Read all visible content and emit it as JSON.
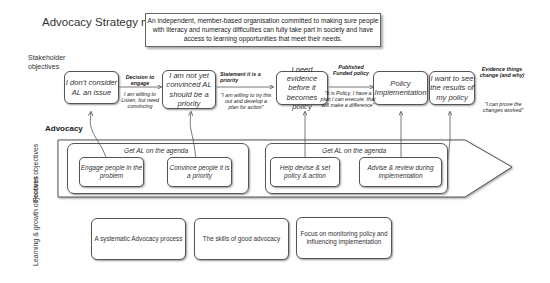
{
  "title": "Advocacy Strategy map",
  "mission": "An independent, member-based organisation committed to making sure people with literacy and numeracy difficulties can fully take part in society and have access to learning opportunities that meet their needs.",
  "row_labels": {
    "stakeholder": "Stakeholder objectives",
    "process": "Process objectives",
    "learning": "Learning & growth objectives"
  },
  "stakeholder_boxes": [
    {
      "text": "I don't consider AL an issue"
    },
    {
      "text": "I am not yet convinced AL should be a priority"
    },
    {
      "text": "I need evidence before it becomes policy"
    },
    {
      "text": "Policy Implementation"
    },
    {
      "text": "I want to see the results of my policy"
    }
  ],
  "transitions": [
    {
      "label": "Decision to engage",
      "quote": "I am willing to Listen, but need convincing"
    },
    {
      "label": "Statement it is a priority",
      "quote": "\"I am willing to try this out and develop a plan for action\""
    },
    {
      "label": "Published Funded policy",
      "quote": "\"It is Policy, I have a plan I can execute, that will make a difference\""
    },
    {
      "label": "Evidence things change (and why)",
      "quote": "\"I can prove the changes worked\""
    }
  ],
  "advocacy_label": "Advocacy",
  "process_groups": [
    {
      "heading": "Get AL on the agenda",
      "boxes": [
        "Engage people in the problem",
        "Convince people it is a priority"
      ]
    },
    {
      "heading": "Get AL on the agenda",
      "boxes": [
        "Help devise & set policy & action",
        "Advise & review during implementation"
      ]
    }
  ],
  "learning_boxes": [
    "A systematic Advocacy process",
    "The skills of good advocacy",
    "Focus on monitoring policy and influencing implementation"
  ]
}
